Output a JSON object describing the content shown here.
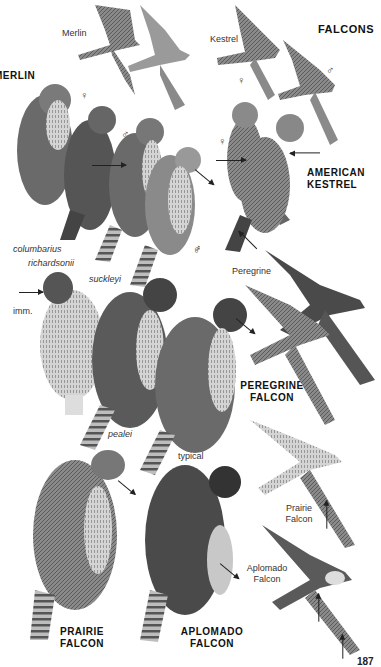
{
  "page": {
    "heading": "FALCONS",
    "page_number": "187"
  },
  "flight_labels": {
    "merlin": "Merlin",
    "kestrel": "Kestrel",
    "peregrine": "Peregrine",
    "prairie": "Prairie Falcon",
    "aplomado": "Aplomado Falcon"
  },
  "species_titles": {
    "merlin": "MERLIN",
    "american_kestrel": "AMERICAN KESTREL",
    "peregrine_falcon": "PEREGRINE FALCON",
    "prairie_falcon": "PRAIRIE FALCON",
    "aplomado_falcon": "APLOMADO FALCON"
  },
  "subspecies": {
    "columbarius": "columbarius",
    "richardsonii": "richardsonii",
    "suckleyi": "suckleyi",
    "pealei": "pealei",
    "typical": "typical",
    "imm": "imm."
  },
  "sex_symbols": {
    "female": "♀",
    "male": "♂"
  },
  "colors": {
    "ink": "#1a1a1a",
    "bird_dark": "#4a4a4a",
    "bird_mid": "#7a7a7a",
    "bird_light": "#c8c8c8",
    "background": "#ffffff"
  }
}
